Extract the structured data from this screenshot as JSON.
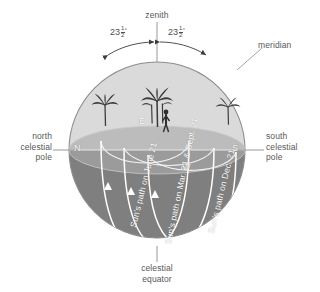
{
  "diagram": {
    "colors": {
      "upper_hemisphere": "#d8d8d8",
      "horizon_plane_front": "#9a9a9a",
      "horizon_plane_back": "#bdbdbd",
      "lower_hemisphere": "#7d7d7d",
      "outline": "#8a8a8a",
      "label_text": "#585858",
      "path_line": "#ffffff",
      "background": "#ffffff"
    },
    "labels": {
      "zenith": "zenith",
      "meridian": "meridian",
      "north_celestial_pole": "north\ncelestial\npole",
      "south_celestial_pole": "south\ncelestial\npole",
      "celestial_equator": "celestial\nequator"
    },
    "angles": [
      {
        "id": "angle-left",
        "whole": "23",
        "numerator": "1",
        "denominator": "2",
        "degree": "°",
        "value_text": "23½°"
      },
      {
        "id": "angle-right",
        "whole": "23",
        "numerator": "1",
        "denominator": "2",
        "degree": "°",
        "value_text": "23½°"
      }
    ],
    "cardinal_points": [
      {
        "id": "north",
        "label": "N"
      },
      {
        "id": "east",
        "label": "E"
      },
      {
        "id": "west",
        "label": "W"
      },
      {
        "id": "south",
        "label": "S"
      }
    ],
    "sun_paths": [
      {
        "id": "path-june",
        "label": "Sun's path on June 21"
      },
      {
        "id": "path-equinox",
        "label": "Sun's path on Mar. 21 & Sept. 21"
      },
      {
        "id": "path-dec",
        "label": "Sun's path on Dec. 21"
      }
    ],
    "scene_icons": [
      {
        "id": "palm-tree-left",
        "name": "palm-tree-icon"
      },
      {
        "id": "palm-tree-center",
        "name": "palm-tree-icon"
      },
      {
        "id": "palm-tree-right",
        "name": "palm-tree-icon"
      },
      {
        "id": "observer",
        "name": "person-figure-icon"
      }
    ]
  }
}
